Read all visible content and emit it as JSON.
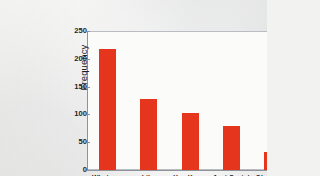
{
  "chart_data": {
    "type": "bar",
    "title": "",
    "xlabel": "",
    "ylabel": "Frequency",
    "categories": [
      "Whatever",
      "Like",
      "You Know",
      "Just Sayin'",
      "Obviously"
    ],
    "values": [
      218,
      128,
      103,
      79,
      32
    ],
    "ylim": [
      0,
      250
    ],
    "yticks": [
      0,
      50,
      100,
      150,
      200,
      250
    ],
    "ytick_labels": [
      "0",
      "50",
      "100",
      "150",
      "200",
      "250"
    ],
    "grid": false,
    "legend": null,
    "bar_color": "#e5351c",
    "frame_color": "#b9bcc0",
    "background_color": "#f2f2f0"
  }
}
